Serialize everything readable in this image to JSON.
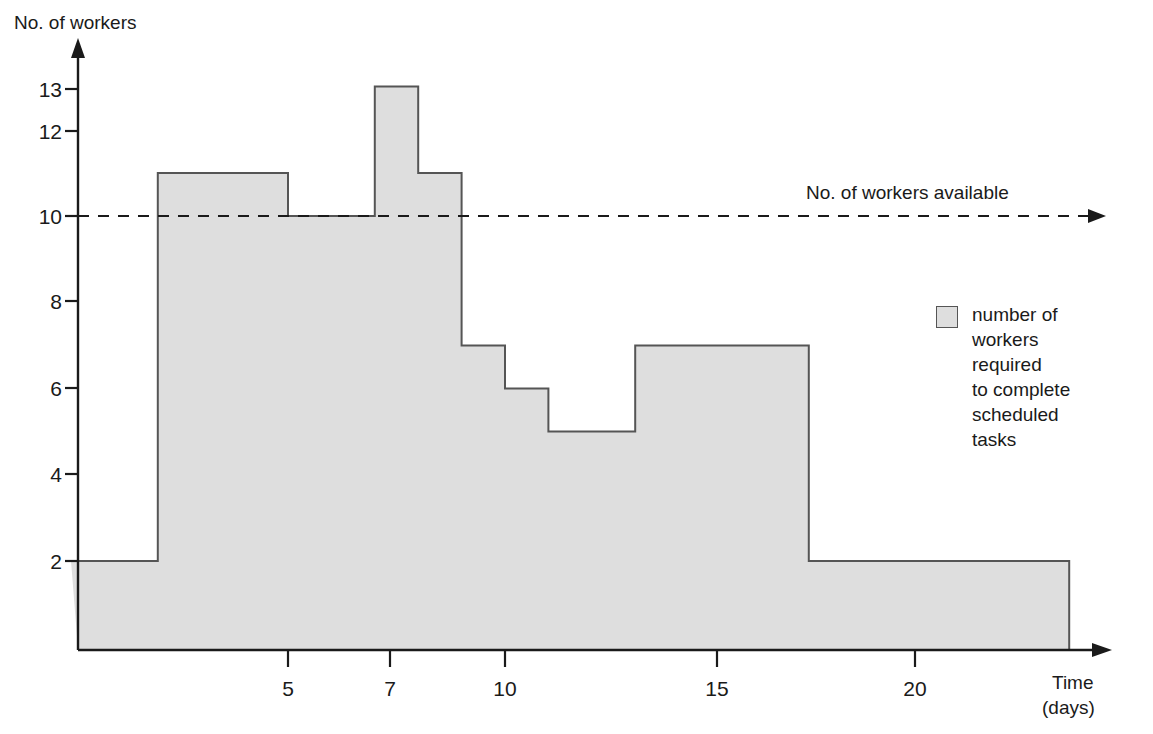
{
  "chart_data": {
    "type": "area",
    "title": "",
    "ylabel": "No. of workers",
    "xlabel": "Time (days)",
    "xlabel_line1": "Time",
    "xlabel_line2": "(days)",
    "ytick_labels": [
      "13",
      "12",
      "10",
      "8",
      "6",
      "4",
      "2"
    ],
    "ytick_values": [
      13,
      12,
      10,
      8,
      6,
      4,
      2
    ],
    "xtick_labels": [
      "5",
      "7",
      "10",
      "15",
      "20"
    ],
    "xtick_values": [
      5,
      7,
      10,
      15,
      20
    ],
    "xlim": [
      0,
      24
    ],
    "ylim": [
      0,
      14
    ],
    "grid": false,
    "step_series_name": "number of workers required to complete scheduled tasks",
    "steps": [
      {
        "x_start": 0,
        "x_end": 2,
        "value": 2
      },
      {
        "x_start": 2,
        "x_end": 5,
        "value": 11
      },
      {
        "x_start": 5,
        "x_end": 7,
        "value": 10
      },
      {
        "x_start": 7,
        "x_end": 8,
        "value": 13
      },
      {
        "x_start": 8,
        "x_end": 9,
        "value": 11
      },
      {
        "x_start": 9,
        "x_end": 10,
        "value": 7
      },
      {
        "x_start": 10,
        "x_end": 11,
        "value": 6
      },
      {
        "x_start": 11,
        "x_end": 13,
        "value": 5
      },
      {
        "x_start": 13,
        "x_end": 17,
        "value": 7
      },
      {
        "x_start": 17,
        "x_end": 23,
        "value": 2
      }
    ],
    "threshold_line": {
      "value": 10,
      "label": "No. of workers available",
      "style": "dashed",
      "arrow": true
    },
    "legend": {
      "position": "right",
      "entries": [
        {
          "swatch_color": "#dedede",
          "lines": [
            "number of",
            "workers",
            "required",
            "to complete",
            "scheduled",
            "tasks"
          ]
        }
      ]
    },
    "colors": {
      "fill": "#dedede",
      "outline": "#555555",
      "axis": "#1a1a1a",
      "text": "#1a1a1a"
    }
  }
}
